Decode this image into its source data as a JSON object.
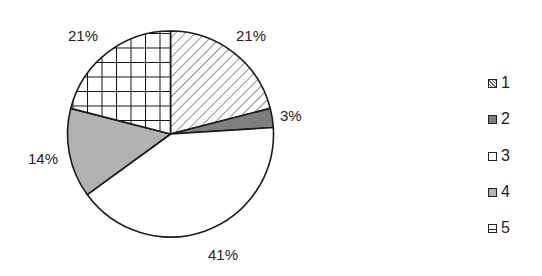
{
  "chart_data": {
    "type": "pie",
    "title": "",
    "categories": [
      "1",
      "2",
      "3",
      "4",
      "5"
    ],
    "values": [
      21,
      3,
      41,
      14,
      21
    ],
    "labels": [
      "21%",
      "3%",
      "41%",
      "14%",
      "21%"
    ],
    "fills": [
      "diagonal-hatch",
      "#7f7f7f",
      "#ffffff",
      "#b2b2b2",
      "grid-hatch"
    ],
    "start_angle": "12 o'clock",
    "direction": "clockwise",
    "legend": {
      "position": "right",
      "entries": [
        "1",
        "2",
        "3",
        "4",
        "5"
      ]
    }
  },
  "slice_labels": {
    "s1": "21%",
    "s2": "3%",
    "s3": "41%",
    "s4": "14%",
    "s5": "21%"
  },
  "legend": {
    "items": [
      {
        "label": "1"
      },
      {
        "label": "2"
      },
      {
        "label": "3"
      },
      {
        "label": "4"
      },
      {
        "label": "5"
      }
    ]
  }
}
